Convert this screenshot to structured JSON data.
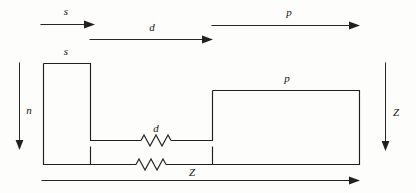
{
  "figure": {
    "background_color": "#fdfdfc",
    "ink_color": "#23201b",
    "labels": {
      "top_arrow_s": "s",
      "top_arrow_d": "d",
      "top_arrow_p": "p",
      "left_box_s": "s",
      "right_box_p": "p",
      "left_vertical_n": "n",
      "right_vertical_z": "Z",
      "middle_connector_d": "d",
      "bottom_span_z": "Z"
    }
  }
}
